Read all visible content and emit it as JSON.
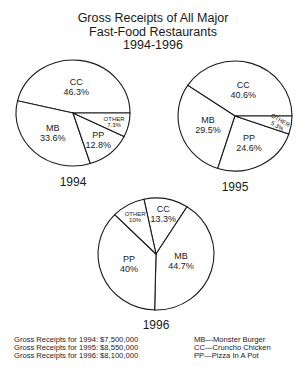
{
  "chart_data": [
    {
      "type": "pie",
      "title": "1994",
      "categories": [
        "CC",
        "MB",
        "PP",
        "OTHER"
      ],
      "values": [
        46.3,
        33.6,
        12.8,
        7.3
      ],
      "labels": [
        "CC\n46.3%",
        "MB\n33.6%",
        "PP\n12.8%",
        "OTHER\n7.3%"
      ]
    },
    {
      "type": "pie",
      "title": "1995",
      "categories": [
        "CC",
        "MB",
        "PP",
        "OTHER"
      ],
      "values": [
        40.6,
        29.5,
        24.6,
        5.3
      ],
      "labels": [
        "CC\n40.6%",
        "MB\n29.5%",
        "PP\n24.6%",
        "OTHER\n5.3%"
      ]
    },
    {
      "type": "pie",
      "title": "1996",
      "categories": [
        "CC",
        "MB",
        "PP",
        "OTHER"
      ],
      "values": [
        13.3,
        44.7,
        40,
        10
      ],
      "labels": [
        "CC\n13.3%",
        "MB\n44.7%",
        "PP\n40%",
        "OTHER\n10%"
      ]
    }
  ],
  "title": {
    "line1": "Gross Receipts of All Major",
    "line2": "Fast-Food Restaurants",
    "line3": "1994-1996"
  },
  "receipts": [
    "Gross Receipts for 1994: $7,500,000",
    "Gross Receipts for 1995: $8,550,000",
    "Gross Receipts for 1996: $8,100,000"
  ],
  "legend": [
    "MB—Monster Burger",
    "CC—Cruncho Chicken",
    "PP—Pizza In A Pot"
  ]
}
